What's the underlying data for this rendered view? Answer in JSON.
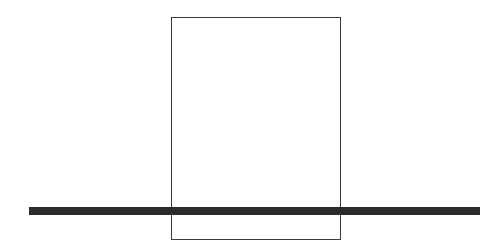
{
  "diagram": {
    "shapes": [
      {
        "type": "rectangle",
        "name": "outline-rectangle",
        "stroke": "#3a3a3a",
        "fill": "none"
      },
      {
        "type": "horizontal-bar",
        "name": "thick-horizontal-line",
        "fill": "#2b2b2b"
      }
    ]
  }
}
